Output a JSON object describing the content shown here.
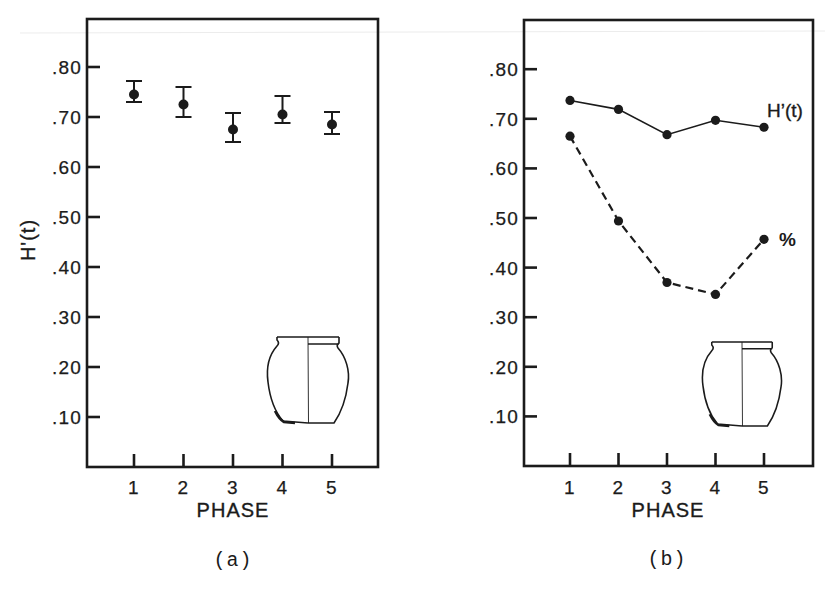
{
  "figure": {
    "panels": [
      {
        "id": "a",
        "caption": "(a)",
        "xlabel": "PHASE",
        "ylabel": "H'(t)",
        "inset_icon": "jar-profile-icon"
      },
      {
        "id": "b",
        "caption": "(b)",
        "xlabel": "PHASE",
        "ylabel": "",
        "inset_icon": "jar-profile-icon"
      }
    ]
  },
  "chart_data": [
    {
      "panel": "a",
      "type": "scatter",
      "title": "",
      "caption": "(a)",
      "xlabel": "PHASE",
      "ylabel": "H'(t)",
      "categories": [
        "1",
        "2",
        "3",
        "4",
        "5"
      ],
      "yticks": [
        0.1,
        0.2,
        0.3,
        0.4,
        0.5,
        0.6,
        0.7,
        0.8
      ],
      "ytick_labels": [
        ".10",
        ".20",
        ".30",
        ".40",
        ".50",
        ".60",
        ".70",
        ".80"
      ],
      "ylim": [
        0,
        0.9
      ],
      "grid": false,
      "legend": "none",
      "series": [
        {
          "name": "H'(t)",
          "style": "points-with-error-bars",
          "values": [
            0.745,
            0.725,
            0.675,
            0.705,
            0.685
          ],
          "err_low": [
            0.73,
            0.7,
            0.65,
            0.688,
            0.666
          ],
          "err_high": [
            0.772,
            0.76,
            0.708,
            0.742,
            0.71
          ]
        }
      ]
    },
    {
      "panel": "b",
      "type": "line",
      "title": "",
      "caption": "(b)",
      "xlabel": "PHASE",
      "ylabel": "",
      "categories": [
        "1",
        "2",
        "3",
        "4",
        "5"
      ],
      "yticks": [
        0.1,
        0.2,
        0.3,
        0.4,
        0.5,
        0.6,
        0.7,
        0.8
      ],
      "ytick_labels": [
        ".10",
        ".20",
        ".30",
        ".40",
        ".50",
        ".60",
        ".70",
        ".80"
      ],
      "ylim": [
        0,
        0.9
      ],
      "grid": false,
      "legend": "inline-end-labels",
      "series": [
        {
          "name": "H’(t)",
          "style": "solid",
          "values": [
            0.737,
            0.719,
            0.668,
            0.697,
            0.683
          ]
        },
        {
          "name": "%",
          "style": "dashed",
          "values": [
            0.665,
            0.494,
            0.37,
            0.346,
            0.457
          ]
        }
      ]
    }
  ]
}
